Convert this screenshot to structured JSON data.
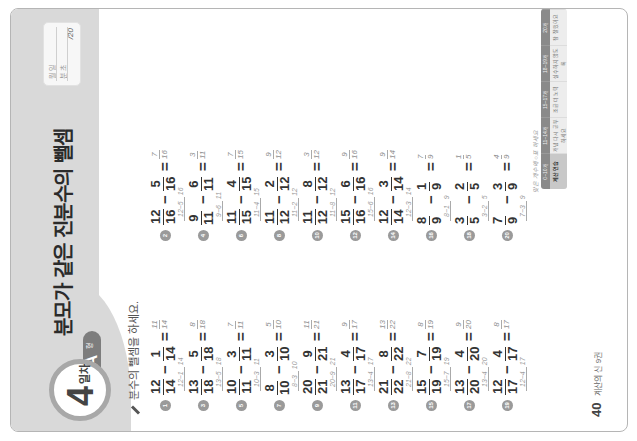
{
  "header": {
    "day_number": "4",
    "day_unit": "일차",
    "type_letter": "A",
    "type_unit": "형",
    "title": "분모가 같은 진분수의 뺄셈",
    "score_box": {
      "date_label": "월 일",
      "score_label": "분 초",
      "total": "/20"
    }
  },
  "instruction": "분수의 뺄셈을 하세요.",
  "problems": [
    {
      "num": "1",
      "a_n": "12",
      "a_d": "14",
      "b_n": "1",
      "b_d": "14",
      "ans_n": "11",
      "ans_d": "14",
      "work": "12−1",
      "work_d": "14"
    },
    {
      "num": "2",
      "a_n": "12",
      "a_d": "16",
      "b_n": "5",
      "b_d": "16",
      "ans_n": "7",
      "ans_d": "16",
      "work": "12−5",
      "work_d": "16"
    },
    {
      "num": "3",
      "a_n": "13",
      "a_d": "18",
      "b_n": "5",
      "b_d": "18",
      "ans_n": "8",
      "ans_d": "18",
      "work": "13−5",
      "work_d": "18"
    },
    {
      "num": "4",
      "a_n": "9",
      "a_d": "11",
      "b_n": "6",
      "b_d": "11",
      "ans_n": "3",
      "ans_d": "11",
      "work": "9−6",
      "work_d": "11"
    },
    {
      "num": "5",
      "a_n": "10",
      "a_d": "11",
      "b_n": "3",
      "b_d": "11",
      "ans_n": "7",
      "ans_d": "11",
      "work": "10−3",
      "work_d": "11"
    },
    {
      "num": "6",
      "a_n": "11",
      "a_d": "15",
      "b_n": "4",
      "b_d": "15",
      "ans_n": "7",
      "ans_d": "15",
      "work": "11−4",
      "work_d": "15"
    },
    {
      "num": "7",
      "a_n": "8",
      "a_d": "10",
      "b_n": "3",
      "b_d": "10",
      "ans_n": "5",
      "ans_d": "10",
      "work": "8−3",
      "work_d": "10"
    },
    {
      "num": "8",
      "a_n": "11",
      "a_d": "12",
      "b_n": "2",
      "b_d": "12",
      "ans_n": "9",
      "ans_d": "12",
      "work": "11−2",
      "work_d": "12"
    },
    {
      "num": "9",
      "a_n": "20",
      "a_d": "21",
      "b_n": "9",
      "b_d": "21",
      "ans_n": "11",
      "ans_d": "21",
      "work": "20−9",
      "work_d": "21"
    },
    {
      "num": "10",
      "a_n": "11",
      "a_d": "12",
      "b_n": "8",
      "b_d": "12",
      "ans_n": "3",
      "ans_d": "12",
      "work": "11−8",
      "work_d": "12"
    },
    {
      "num": "11",
      "a_n": "13",
      "a_d": "17",
      "b_n": "4",
      "b_d": "17",
      "ans_n": "9",
      "ans_d": "17",
      "work": "13−4",
      "work_d": "17"
    },
    {
      "num": "12",
      "a_n": "15",
      "a_d": "16",
      "b_n": "6",
      "b_d": "16",
      "ans_n": "9",
      "ans_d": "16",
      "work": "15−6",
      "work_d": "16"
    },
    {
      "num": "13",
      "a_n": "21",
      "a_d": "22",
      "b_n": "8",
      "b_d": "22",
      "ans_n": "13",
      "ans_d": "22",
      "work": "21−8",
      "work_d": "22"
    },
    {
      "num": "14",
      "a_n": "12",
      "a_d": "14",
      "b_n": "3",
      "b_d": "14",
      "ans_n": "9",
      "ans_d": "14",
      "work": "12−3",
      "work_d": "14"
    },
    {
      "num": "15",
      "a_n": "15",
      "a_d": "19",
      "b_n": "7",
      "b_d": "19",
      "ans_n": "8",
      "ans_d": "19",
      "work": "15−7",
      "work_d": "19"
    },
    {
      "num": "16",
      "a_n": "8",
      "a_d": "9",
      "b_n": "1",
      "b_d": "9",
      "ans_n": "7",
      "ans_d": "9",
      "work": "8−1",
      "work_d": "9"
    },
    {
      "num": "17",
      "a_n": "13",
      "a_d": "20",
      "b_n": "4",
      "b_d": "20",
      "ans_n": "9",
      "ans_d": "20",
      "work": "13−4",
      "work_d": "20"
    },
    {
      "num": "18",
      "a_n": "3",
      "a_d": "5",
      "b_n": "2",
      "b_d": "5",
      "ans_n": "1",
      "ans_d": "5",
      "work": "3−2",
      "work_d": "5"
    },
    {
      "num": "19",
      "a_n": "12",
      "a_d": "17",
      "b_n": "4",
      "b_d": "17",
      "ans_n": "8",
      "ans_d": "17",
      "work": "12−4",
      "work_d": "17"
    },
    {
      "num": "20",
      "a_n": "7",
      "a_d": "9",
      "b_n": "3",
      "b_d": "9",
      "ans_n": "4",
      "ans_d": "9",
      "work": "7−3",
      "work_d": "9"
    }
  ],
  "note": "맞은 개수에 ○표 하세요",
  "level_table": {
    "headers": [
      "0~10개",
      "11~14개",
      "15~17개",
      "18~19개",
      "20개"
    ],
    "cells": [
      "계산 연습",
      "개념 다시 공부하세요",
      "조금 더 노력",
      "실수하지 않도록",
      "참 잘했어요"
    ]
  },
  "footer": {
    "page": "40",
    "book": "계산의 신 9권"
  }
}
